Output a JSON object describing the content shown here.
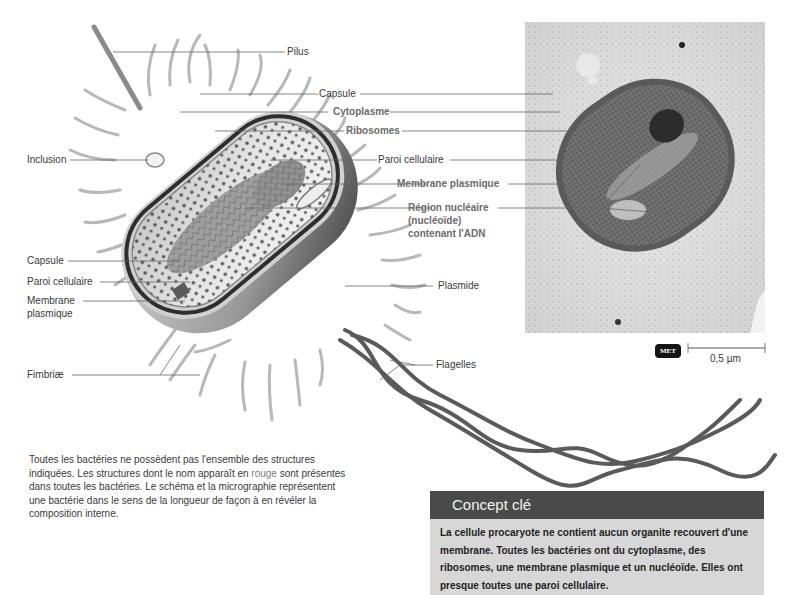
{
  "diagram": {
    "labels_left": [
      {
        "id": "inclusion",
        "text": "Inclusion"
      },
      {
        "id": "capsule",
        "text": "Capsule"
      },
      {
        "id": "paroi",
        "text": "Paroi cellulaire"
      },
      {
        "id": "membrane_1",
        "text": "Membrane"
      },
      {
        "id": "membrane_2",
        "text": "plasmique"
      },
      {
        "id": "fimbriae",
        "text": "Fimbriæ"
      }
    ],
    "labels_right": [
      {
        "id": "pilus",
        "text": "Pilus",
        "essential": false
      },
      {
        "id": "capsule",
        "text": "Capsule",
        "essential": false
      },
      {
        "id": "cytoplasme",
        "text": "Cytoplasme",
        "essential": true
      },
      {
        "id": "ribosomes",
        "text": "Ribosomes",
        "essential": true
      },
      {
        "id": "paroi",
        "text": "Paroi cellulaire",
        "essential": false
      },
      {
        "id": "membrane",
        "text": "Membrane plasmique",
        "essential": true
      },
      {
        "id": "nucleoide_1",
        "text": "Région nucléaire",
        "essential": true
      },
      {
        "id": "nucleoide_2",
        "text": "(nucléoïde)",
        "essential": true
      },
      {
        "id": "nucleoide_3",
        "text": "contenant l'ADN",
        "essential": true
      },
      {
        "id": "plasmide",
        "text": "Plasmide",
        "essential": false
      },
      {
        "id": "flagelles",
        "text": "Flagelles",
        "essential": false
      }
    ],
    "micrograph": {
      "badge": "MET",
      "scale_label": "0,5 µm"
    },
    "caption": {
      "part1": "Toutes les bactéries ne possèdent pas l'ensemble des structures indiquées. Les structures dont le nom apparaît en ",
      "highlight": "rouge",
      "part2": " sont présentes dans toutes les bactéries. Le schéma et la micrographie représentent une bactérie dans le sens de la longueur de façon à en révéler la composition interne."
    },
    "concept": {
      "title": "Concept clé",
      "body": "La cellule procaryote ne contient aucun organite recouvert d'une membrane. Toutes les bactéries ont du cytoplasme, des ribosomes, une membrane plasmique et un nucléoïde. Elles ont presque toutes une paroi cellulaire."
    },
    "colors": {
      "essential_label": "#6b6b6b",
      "label": "#3a3a3a",
      "concept_header": "#4a4a4a",
      "concept_body_bg": "#d7d7d7"
    }
  }
}
